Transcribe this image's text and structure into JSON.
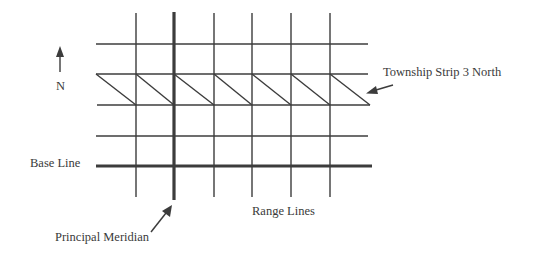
{
  "diagram": {
    "colors": {
      "line": "#3c3c3c",
      "text": "#3a3a3a",
      "background": "#ffffff"
    },
    "grid": {
      "range_lines_x": [
        136,
        214,
        252,
        291,
        330
      ],
      "principal_meridian_x": 174,
      "township_lines_y": [
        44,
        74,
        105,
        136
      ],
      "base_line_y": 166,
      "x_start": 96,
      "x_end": 370,
      "y_top": 13,
      "y_bottom": 197,
      "township_strip": {
        "top_y": 74,
        "bottom_y": 105,
        "row": 3,
        "direction": "North"
      }
    },
    "labels": {
      "north": "N",
      "township_strip": "Township Strip 3 North",
      "base_line": "Base Line",
      "range_lines": "Range Lines",
      "principal_meridian": "Principal Meridian"
    },
    "icons": {
      "north_arrow": "arrow-up-icon",
      "township_arrow": "arrow-left-icon",
      "meridian_arrow": "arrow-up-right-icon"
    }
  }
}
